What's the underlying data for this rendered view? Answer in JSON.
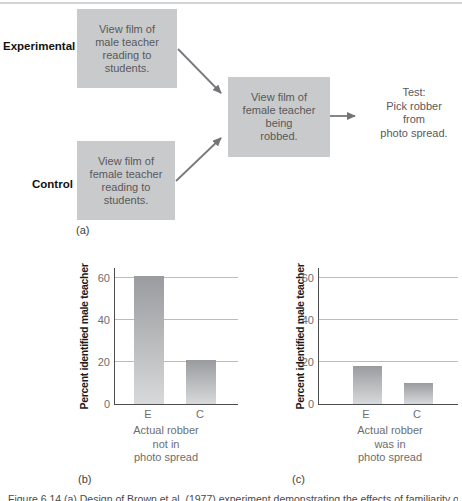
{
  "figure": {
    "caption_fragment": "Figure 6.14 (a) Design of Brown et al. (1977) experiment demonstrating the effects of familiarity on eyewitness identification."
  },
  "diagram": {
    "panel_label": "(a)",
    "experimental_label": "Experimental",
    "control_label": "Control",
    "experimental_box": {
      "lines": [
        "View film of",
        "male teacher",
        "reading to",
        "students."
      ]
    },
    "control_box": {
      "lines": [
        "View film of",
        "female teacher",
        "reading to",
        "students."
      ]
    },
    "middle_box": {
      "lines": [
        "View film of",
        "female teacher",
        "being",
        "robbed."
      ]
    },
    "test_text": {
      "lines": [
        "Test:",
        "Pick robber",
        "from",
        "photo spread."
      ]
    },
    "arrows": [
      "experimental-to-film",
      "control-to-film",
      "film-to-test"
    ]
  },
  "chart_data": [
    {
      "type": "bar",
      "panel_label": "(b)",
      "categories": [
        "E",
        "C"
      ],
      "values": [
        61,
        21
      ],
      "title": "",
      "xlabel": "",
      "ylabel": "Percent identified male teacher",
      "yticks": [
        0,
        20,
        40,
        60
      ],
      "ylim": [
        0,
        64
      ],
      "grid": "horizontal",
      "legend": "none",
      "note_lines": [
        "Actual robber",
        "not in",
        "photo spread"
      ],
      "note": "Actual robber not in photo spread"
    },
    {
      "type": "bar",
      "panel_label": "(c)",
      "categories": [
        "E",
        "C"
      ],
      "values": [
        18,
        10
      ],
      "title": "",
      "xlabel": "",
      "ylabel": "Percent identified male teacher",
      "yticks": [
        0,
        20,
        40,
        60
      ],
      "ylim": [
        0,
        64
      ],
      "grid": "horizontal",
      "legend": "none",
      "note_lines": [
        "Actual robber",
        "was in",
        "photo spread"
      ],
      "note": "Actual robber was in photo spread"
    }
  ],
  "colors": {
    "box_fill": "#c9cacb",
    "bar_gradient_top": "#999b9e",
    "bar_gradient_bottom": "#d8d9da",
    "arrow": "#78797c",
    "gridline": "#bbbcbe",
    "axis": "#4c4d4f",
    "top_rule": "#d2d3d4",
    "muted_text": "#6d6e71",
    "box_text": "#58595b"
  }
}
